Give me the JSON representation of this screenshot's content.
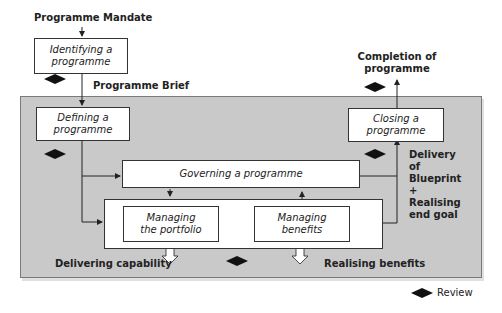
{
  "diagram": {
    "inputs": {
      "mandate": "Programme Mandate",
      "brief": "Programme Brief"
    },
    "processes": {
      "identifying": "Identifying a programme",
      "defining": "Defining a programme",
      "governing": "Governing a programme",
      "managing_portfolio": "Managing the portfolio",
      "managing_benefits": "Managing benefits",
      "closing": "Closing a programme"
    },
    "outputs": {
      "completion": "Completion of programme",
      "delivery": "Delivery of Blueprint + Realising end goal",
      "delivering_capability": "Delivering capability",
      "realising_benefits": "Realising benefits"
    },
    "legend": {
      "review": "Review"
    },
    "colors": {
      "panel": "#c9c9c9",
      "box": "#ffffff",
      "line": "#222222"
    }
  }
}
